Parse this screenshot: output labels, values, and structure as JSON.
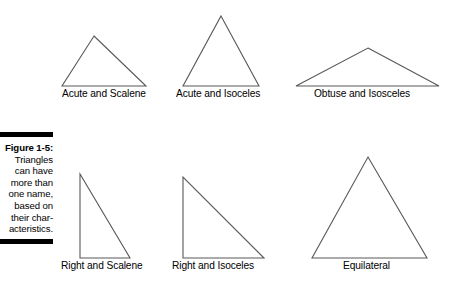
{
  "figure": {
    "caption_label": "Figure 1-5:",
    "caption_lines": [
      "Triangles",
      "can have",
      "more than",
      "one name,",
      "based on",
      "their char-",
      "acteristics."
    ],
    "rule_color": "#000000",
    "stroke_color": "#58585a",
    "background": "#ffffff"
  },
  "diagram_data": {
    "type": "diagram",
    "title": "Triangle classification examples",
    "shapes": [
      {
        "id": "acute-scalene",
        "label": "Acute and Scalene",
        "classification": [
          "acute",
          "scalene"
        ],
        "points": "94,36 146,86 62,86",
        "label_x": 62,
        "label_y": 88
      },
      {
        "id": "acute-isoceles",
        "label": "Acute and Isoceles",
        "classification": [
          "acute",
          "isosceles"
        ],
        "points": "221,16 259,86 183,86",
        "label_x": 176,
        "label_y": 88
      },
      {
        "id": "obtuse-isosceles",
        "label": "Obtuse and Isosceles",
        "classification": [
          "obtuse",
          "isosceles"
        ],
        "points": "368,48 439,86 296,86",
        "label_x": 314,
        "label_y": 88
      },
      {
        "id": "right-scalene",
        "label": "Right and Scalene",
        "classification": [
          "right",
          "scalene"
        ],
        "points": "80,174 80,258 130,258",
        "label_x": 61,
        "label_y": 260
      },
      {
        "id": "right-isoceles",
        "label": "Right and Isoceles",
        "classification": [
          "right",
          "isosceles"
        ],
        "points": "183,177 183,258 264,258",
        "label_x": 172,
        "label_y": 260
      },
      {
        "id": "equilateral",
        "label": "Equilateral",
        "classification": [
          "equilateral"
        ],
        "points": "368,157 427,258 312,258",
        "label_x": 343,
        "label_y": 260
      }
    ]
  }
}
